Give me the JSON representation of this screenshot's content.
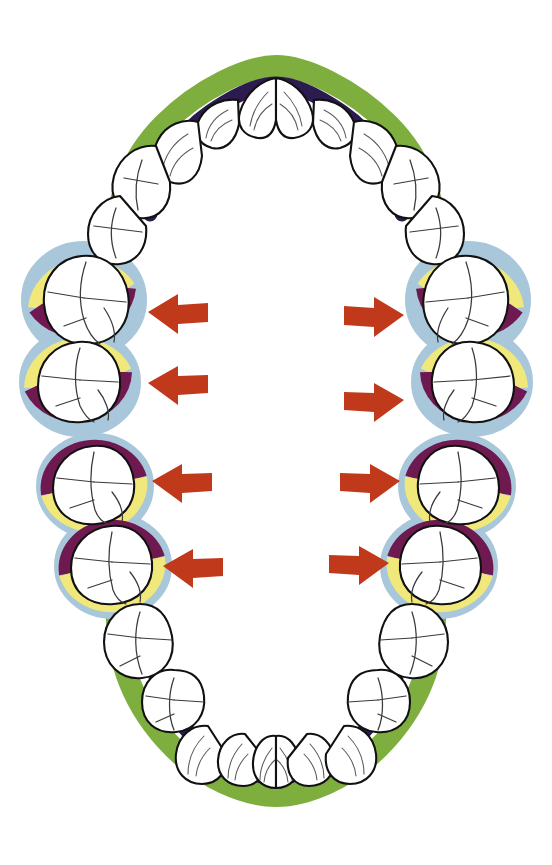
{
  "diagram": {
    "type": "dental-arch",
    "canvas": {
      "width": 552,
      "height": 865,
      "background": "#ffffff"
    },
    "colors": {
      "gum_green": "#7DAE3E",
      "gum_navy": "#2B1B4E",
      "halo_blue": "#A9C7DB",
      "band_yellow": "#F0E87A",
      "band_purple": "#6E1A50",
      "arrow_red": "#C0391B",
      "tooth_fill": "#FFFFFF",
      "tooth_outline": "#111111",
      "fissure_line": "#3A3A3A"
    },
    "legend_note": "Green/navy gingival band surrounds anterior teeth and premolars; blue halo with yellow and purple bands marks the four highlighted molar pairs.",
    "arch": {
      "upper_label": "upper arch",
      "lower_label": "lower arch",
      "band_outer_label": "green gingival outline",
      "band_inner_label": "navy gingival outline"
    },
    "highlight": {
      "halo_label": "blue highlight halo",
      "yellow_band_label": "yellow band",
      "purple_band_label": "purple band",
      "count": 4
    },
    "arrows": [
      {
        "id": "arrow-upper-left",
        "direction": "left",
        "x": 148,
        "y": 312,
        "target": "upper-left-first-molar"
      },
      {
        "id": "arrow-lower-left",
        "direction": "left",
        "x": 148,
        "y": 383,
        "target": "upper-left-second-molar"
      },
      {
        "id": "arrow-mid-left",
        "direction": "left",
        "x": 152,
        "y": 481,
        "target": "lower-left-first-molar"
      },
      {
        "id": "arrow-bottom-left",
        "direction": "left",
        "x": 163,
        "y": 566,
        "target": "lower-left-second-molar"
      },
      {
        "id": "arrow-upper-right",
        "direction": "right",
        "x": 386,
        "y": 315,
        "target": "upper-right-first-molar"
      },
      {
        "id": "arrow-lower-right",
        "direction": "right",
        "x": 386,
        "y": 400,
        "target": "upper-right-second-molar"
      },
      {
        "id": "arrow-mid-right",
        "direction": "right",
        "x": 378,
        "y": 481,
        "target": "lower-right-first-molar"
      },
      {
        "id": "arrow-bottom-right",
        "direction": "right",
        "x": 357,
        "y": 563,
        "target": "lower-right-second-molar"
      }
    ],
    "teeth": {
      "upper_anterior": [
        {
          "id": "u-central-incisor-left",
          "type": "incisor",
          "label": "upper left central incisor"
        },
        {
          "id": "u-central-incisor-right",
          "type": "incisor",
          "label": "upper right central incisor"
        },
        {
          "id": "u-lateral-incisor-left",
          "type": "incisor",
          "label": "upper left lateral incisor"
        },
        {
          "id": "u-lateral-incisor-right",
          "type": "incisor",
          "label": "upper right lateral incisor"
        },
        {
          "id": "u-canine-left",
          "type": "canine",
          "label": "upper left canine"
        },
        {
          "id": "u-canine-right",
          "type": "canine",
          "label": "upper right canine"
        }
      ],
      "upper_premolars": [
        {
          "id": "u-premolar1-left",
          "type": "premolar",
          "label": "upper left first premolar"
        },
        {
          "id": "u-premolar2-left",
          "type": "premolar",
          "label": "upper left second premolar"
        },
        {
          "id": "u-premolar1-right",
          "type": "premolar",
          "label": "upper right first premolar"
        },
        {
          "id": "u-premolar2-right",
          "type": "premolar",
          "label": "upper right second premolar"
        }
      ],
      "highlighted_molars": [
        {
          "id": "molar-upper-left",
          "label": "upper left molar",
          "highlight": true
        },
        {
          "id": "molar-lower-left",
          "label": "lower left molar",
          "highlight": true
        },
        {
          "id": "molar-upper-right",
          "label": "upper right molar",
          "highlight": true
        },
        {
          "id": "molar-lower-right",
          "label": "lower right molar",
          "highlight": true
        }
      ],
      "lower_premolars": [
        {
          "id": "l-premolar1-left",
          "type": "premolar",
          "label": "lower left first premolar"
        },
        {
          "id": "l-premolar2-left",
          "type": "premolar",
          "label": "lower left second premolar"
        },
        {
          "id": "l-premolar1-right",
          "type": "premolar",
          "label": "lower right first premolar"
        },
        {
          "id": "l-premolar2-right",
          "type": "premolar",
          "label": "lower right second premolar"
        }
      ],
      "lower_anterior": [
        {
          "id": "l-central-incisor-left",
          "type": "incisor",
          "label": "lower left central incisor"
        },
        {
          "id": "l-central-incisor-right",
          "type": "incisor",
          "label": "lower right central incisor"
        },
        {
          "id": "l-lateral-incisor-left",
          "type": "incisor",
          "label": "lower left lateral incisor"
        },
        {
          "id": "l-lateral-incisor-right",
          "type": "incisor",
          "label": "lower right lateral incisor"
        },
        {
          "id": "l-canine-left",
          "type": "canine",
          "label": "lower left canine"
        },
        {
          "id": "l-canine-right",
          "type": "canine",
          "label": "lower right canine"
        }
      ]
    }
  }
}
